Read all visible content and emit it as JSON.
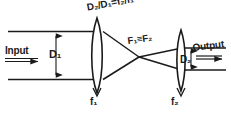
{
  "figure": {
    "kind": "optical-beam-expander-diagram",
    "background_color": "#ffffff",
    "ink_color": "#1a1a1a",
    "width": 231,
    "height": 114
  },
  "annotations": {
    "ratio_relation": "D₂/D₁=f₂/f₁",
    "focal_coincidence": "F₁≡F₂",
    "input_label": "Input",
    "output_label": "Output",
    "input_diameter_label": "D₁",
    "output_diameter_label": "D₂",
    "first_lens_label": "f₁",
    "second_lens_label": "f₂"
  },
  "elements": {
    "lens1_name": "first-converging-lens",
    "lens2_name": "second-converging-lens",
    "input_beam_name": "input-collimated-beam",
    "output_beam_name": "output-collimated-beam",
    "converging_rays_name": "converging-ray-bundle",
    "diverging_rays_name": "diverging-ray-bundle"
  }
}
